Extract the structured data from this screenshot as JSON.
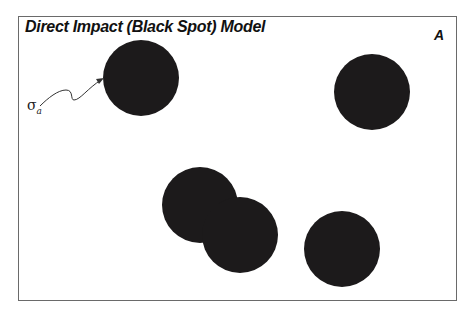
{
  "figure": {
    "title": "Direct Impact (Black Spot) Model",
    "panel_label": "A",
    "annotation": {
      "symbol": "σ",
      "subscript": "a"
    },
    "spot_color": "#1c1a1b",
    "frame_color": "#6a6a6a"
  },
  "spots": [
    {
      "cx": 141,
      "cy": 78,
      "r": 38
    },
    {
      "cx": 372,
      "cy": 92,
      "r": 38
    },
    {
      "cx": 200,
      "cy": 205,
      "r": 38
    },
    {
      "cx": 240,
      "cy": 235,
      "r": 38
    },
    {
      "cx": 342,
      "cy": 249,
      "r": 38
    }
  ]
}
